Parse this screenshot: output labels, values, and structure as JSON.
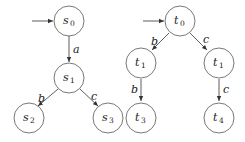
{
  "diagram": {
    "left_tree": {
      "nodes": [
        {
          "id": "s0",
          "base": "s",
          "sub": "0",
          "initial": true
        },
        {
          "id": "s1",
          "base": "s",
          "sub": "1"
        },
        {
          "id": "s2",
          "base": "s",
          "sub": "2"
        },
        {
          "id": "s3",
          "base": "s",
          "sub": "3"
        }
      ],
      "edges": [
        {
          "from": "s0",
          "to": "s1",
          "label": "a"
        },
        {
          "from": "s1",
          "to": "s2",
          "label": "b"
        },
        {
          "from": "s1",
          "to": "s3",
          "label": "c"
        }
      ]
    },
    "right_tree": {
      "nodes": [
        {
          "id": "t0",
          "base": "t",
          "sub": "0",
          "initial": true
        },
        {
          "id": "t1a",
          "base": "t",
          "sub": "1"
        },
        {
          "id": "t1b",
          "base": "t",
          "sub": "1"
        },
        {
          "id": "t3",
          "base": "t",
          "sub": "3"
        },
        {
          "id": "t4",
          "base": "t",
          "sub": "4"
        }
      ],
      "edges": [
        {
          "from": "t0",
          "to": "t1a",
          "label": "b"
        },
        {
          "from": "t0",
          "to": "t1b",
          "label": "c"
        },
        {
          "from": "t1a",
          "to": "t3",
          "label": "b"
        },
        {
          "from": "t1b",
          "to": "t4",
          "label": "c"
        }
      ]
    }
  }
}
